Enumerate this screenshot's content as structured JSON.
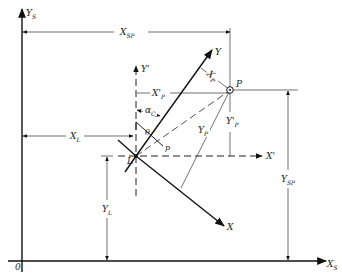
{
  "diagram": {
    "title": "",
    "labels": {
      "ys_axis": "Y",
      "ys_axis_sub": "S",
      "xs_axis": "X",
      "xs_axis_sub": "S",
      "origin": "0",
      "xsp": "X",
      "xsp_sub": "SP",
      "ysp": "Y",
      "ysp_sub": "SP",
      "xl": "X",
      "xl_sub": "L",
      "yl": "Y",
      "yl_sub": "L",
      "y_prime": "Y'",
      "x_prime": "X'",
      "xp_prime": "X'",
      "xp_prime_sub": "P",
      "yp_prime": "Y'",
      "yp_prime_sub": "P",
      "y_axis": "Y",
      "x_axis": "X",
      "xp": "X",
      "xp_sub": "P",
      "yp": "Y",
      "yp_sub": "P",
      "alpha_c": "α",
      "alpha_c_sub": "C",
      "point_p": "P",
      "point_l": "L",
      "theta": "θ",
      "p_small": "p"
    }
  }
}
